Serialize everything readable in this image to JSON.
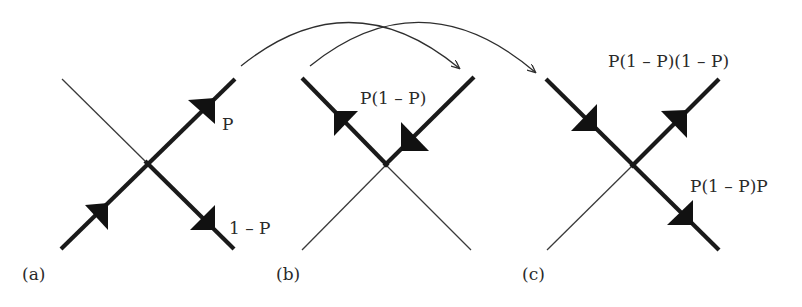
{
  "diagram": {
    "colors": {
      "line": "#1a1a1a",
      "background": "#ffffff"
    },
    "panels": [
      {
        "id": "a",
        "caption": "(a)",
        "labels": {
          "upper_right": "P",
          "lower_right": "1 – P"
        }
      },
      {
        "id": "b",
        "caption": "(b)",
        "labels": {
          "top": "P(1 – P)"
        }
      },
      {
        "id": "c",
        "caption": "(c)",
        "labels": {
          "upper_right": "P(1 – P)(1 – P)",
          "lower_right": "P(1 – P)P"
        }
      }
    ],
    "transitions": [
      {
        "from": "a",
        "to": "b"
      },
      {
        "from": "b",
        "to": "c"
      }
    ]
  }
}
